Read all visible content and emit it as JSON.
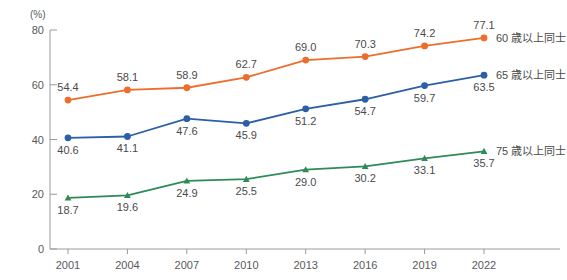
{
  "chart_data": {
    "type": "line",
    "title": "",
    "xlabel": "",
    "ylabel": "",
    "yunit": "(%)",
    "ylim": [
      0,
      80
    ],
    "yticks": [
      0,
      20,
      40,
      60,
      80
    ],
    "grid": false,
    "legend_position": "right-inline",
    "categories": [
      "2001",
      "2004",
      "2007",
      "2010",
      "2013",
      "2016",
      "2019",
      "2022"
    ],
    "series": [
      {
        "name": "60 歳以上同士",
        "color": "#ED6D2D",
        "label_position": "above",
        "marker": "circle",
        "values": [
          54.4,
          58.1,
          58.9,
          62.7,
          69.0,
          70.3,
          74.2,
          77.1
        ],
        "value_labels": [
          "54.4",
          "58.1",
          "58.9",
          "62.7",
          "69.0",
          "70.3",
          "74.2",
          "77.1"
        ]
      },
      {
        "name": "65 歳以上同士",
        "color": "#2B5FA8",
        "label_position": "below",
        "marker": "circle",
        "values": [
          40.6,
          41.1,
          47.6,
          45.9,
          51.2,
          54.7,
          59.7,
          63.5
        ],
        "value_labels": [
          "40.6",
          "41.1",
          "47.6",
          "45.9",
          "51.2",
          "54.7",
          "59.7",
          "63.5"
        ]
      },
      {
        "name": "75 歳以上同士",
        "color": "#2E8B57",
        "label_position": "below",
        "marker": "triangle",
        "values": [
          18.7,
          19.6,
          24.9,
          25.5,
          29.0,
          30.2,
          33.1,
          35.7
        ],
        "value_labels": [
          "18.7",
          "19.6",
          "24.9",
          "25.5",
          "29.0",
          "30.2",
          "33.1",
          "35.7"
        ]
      }
    ]
  }
}
